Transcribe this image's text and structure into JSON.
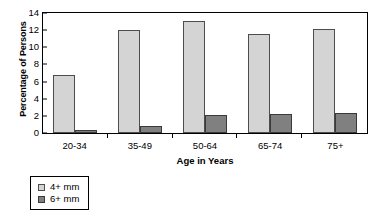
{
  "chart_data": {
    "type": "bar",
    "title": "",
    "xlabel": "Age in Years",
    "ylabel": "Percentage of Persons",
    "categories": [
      "20-34",
      "35-49",
      "50-64",
      "65-74",
      "75+"
    ],
    "series": [
      {
        "name": "4+ mm",
        "color": "#d4d4d4",
        "values": [
          6.8,
          12.0,
          13.1,
          11.5,
          12.1
        ]
      },
      {
        "name": "6+ mm",
        "color": "#808080",
        "values": [
          0.3,
          0.8,
          2.1,
          2.2,
          2.3
        ]
      }
    ],
    "ylim": [
      0,
      14
    ],
    "yticks": [
      0,
      2,
      4,
      6,
      8,
      10,
      12,
      14
    ],
    "ytick_labels": [
      "0",
      "2",
      "4",
      "6",
      "8",
      "10",
      "12",
      "14"
    ],
    "grid": false,
    "legend_position": "below-left"
  },
  "legend": {
    "entries": [
      {
        "label": "4+ mm",
        "swatch": "light-gray-swatch"
      },
      {
        "label": "6+ mm",
        "swatch": "dark-gray-swatch"
      }
    ]
  }
}
